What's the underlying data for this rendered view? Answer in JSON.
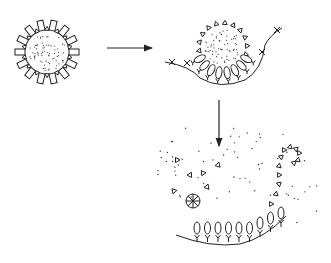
{
  "diagram": {
    "title": "",
    "background": "#ffffff",
    "stroke_color": "#222222",
    "stages": [
      {
        "id": "stage-1",
        "label": "",
        "description": "Spherical particle with dotted core surrounded by radial rectangular and triangular projections"
      },
      {
        "id": "stage-2",
        "label": "",
        "description": "Particle attaching to membrane surface; rectangular projections bind to receptors on curved membrane"
      },
      {
        "id": "stage-3",
        "label": "",
        "description": "Particle disassembled; triangles and dots dispersed, rectangular projections remain bound to membrane"
      }
    ],
    "arrows": [
      {
        "id": "arrow-1",
        "from": "stage-1",
        "to": "stage-2",
        "direction": "right"
      },
      {
        "id": "arrow-2",
        "from": "stage-2",
        "to": "stage-3",
        "direction": "down"
      }
    ]
  }
}
